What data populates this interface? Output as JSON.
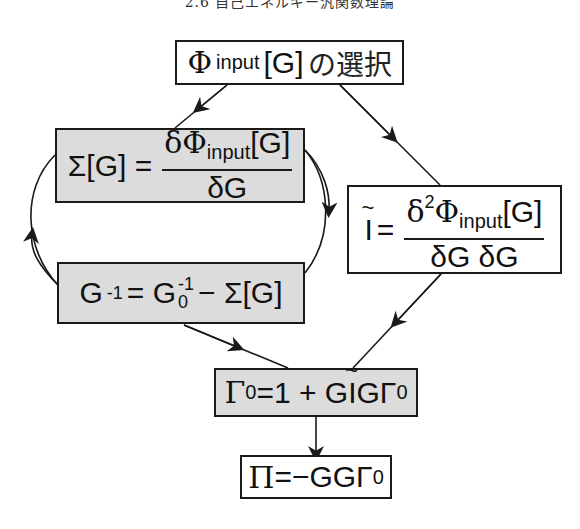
{
  "header": {
    "text": "2.6 自己エネルギー汎関数理論"
  },
  "boxes": {
    "choose_phi": {
      "phi": "Φ",
      "sub": "input",
      "arg": "[G]",
      "jp": "の選択"
    },
    "sigma": {
      "lhs": "Σ[G] =",
      "num_delta": "δ",
      "num_phi": "Φ",
      "num_sub": "input",
      "num_arg": "[G]",
      "den": "δG"
    },
    "i_tilde": {
      "lhs": "I",
      "eq": "=",
      "num_delta": "δ",
      "num_sup": "2",
      "num_phi": "Φ",
      "num_sub": "input",
      "num_arg": "[G]",
      "den": "δG δG"
    },
    "dyson": {
      "g": "G",
      "sup_inv": "-1",
      "eq": "= G",
      "sub0": "0",
      "sup_inv2": "-1",
      "rest": "− Σ[G]"
    },
    "gamma": {
      "g0": "Γ",
      "sub0": "0",
      "eq": "=1 + G",
      "i": "I",
      "rest": "GΓ",
      "sub0b": "0"
    },
    "pi": {
      "pi": "Π",
      "eq": "=−GGΓ",
      "sub0": "0"
    }
  },
  "colors": {
    "shaded_fill": "#dcdcdc",
    "line": "#1a1a1a"
  }
}
